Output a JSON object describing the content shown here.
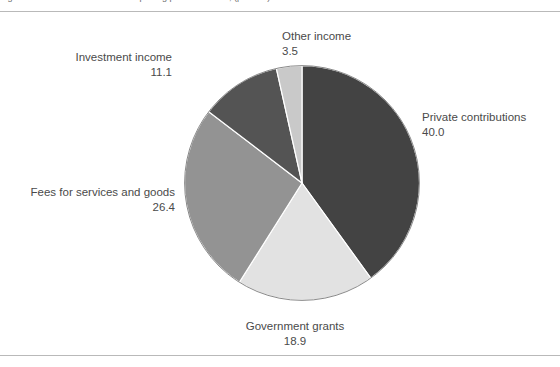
{
  "figure": {
    "title_clipped": "Figure 1. Sources of revenue for reporting public charities, (percent)",
    "background_color": "#ffffff",
    "rule_color": "#b9b9b9"
  },
  "chart_data": {
    "type": "pie",
    "title": "",
    "xlabel": "",
    "ylabel": "",
    "units": "percent",
    "legend_position": "none",
    "grid": false,
    "start_angle_deg": 0,
    "direction": "clockwise",
    "categories": [
      "Private contributions",
      "Government grants",
      "Fees for services and goods",
      "Investment income",
      "Other income"
    ],
    "values": [
      40.0,
      18.9,
      26.4,
      11.1,
      3.5
    ],
    "value_labels": [
      "40.0",
      "18.9",
      "26.4",
      "11.1",
      "3.5"
    ],
    "colors": [
      "#434343",
      "#e2e2e2",
      "#939393",
      "#545454",
      "#c9c9c9"
    ],
    "slices": [
      {
        "label": "Private contributions",
        "value": 40.0,
        "value_label": "40.0",
        "color": "#434343"
      },
      {
        "label": "Government grants",
        "value": 18.9,
        "value_label": "18.9",
        "color": "#e2e2e2"
      },
      {
        "label": "Fees for services and goods",
        "value": 26.4,
        "value_label": "26.4",
        "color": "#939393"
      },
      {
        "label": "Investment income",
        "value": 11.1,
        "value_label": "11.1",
        "color": "#545454"
      },
      {
        "label": "Other income",
        "value": 3.5,
        "value_label": "3.5",
        "color": "#c9c9c9"
      }
    ]
  },
  "labels": {
    "other_income": {
      "name": "Other income",
      "value": "3.5"
    },
    "private": {
      "name": "Private contributions",
      "value": "40.0"
    },
    "investment": {
      "name": "Investment income",
      "value": "11.1"
    },
    "fees": {
      "name": "Fees for services and goods",
      "value": "26.4"
    },
    "government": {
      "name": "Government grants",
      "value": "18.9"
    }
  }
}
